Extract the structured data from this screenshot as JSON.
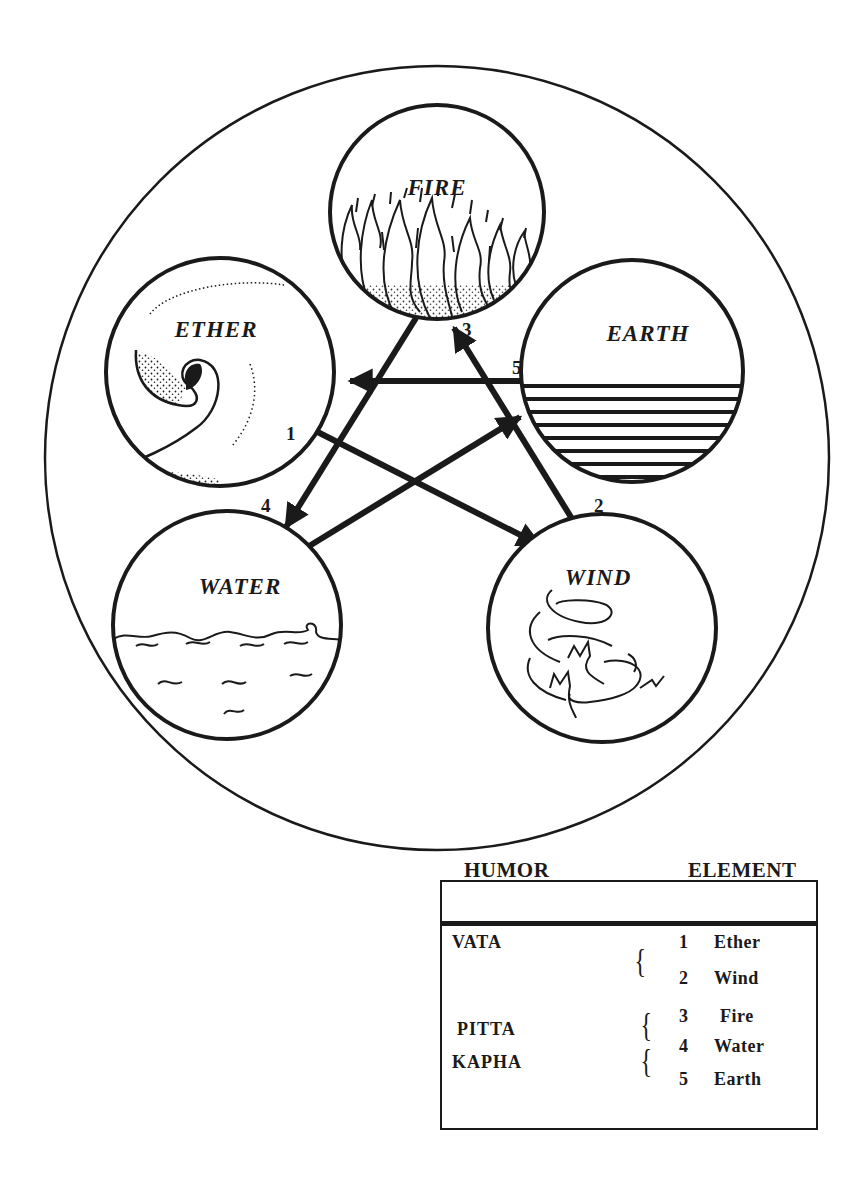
{
  "diagram": {
    "elements": [
      {
        "id": "fire",
        "label": "FIRE",
        "number": "3"
      },
      {
        "id": "ether",
        "label": "ETHER",
        "number": "1"
      },
      {
        "id": "earth",
        "label": "EARTH",
        "number": "5"
      },
      {
        "id": "water",
        "label": "WATER",
        "number": "4"
      },
      {
        "id": "wind",
        "label": "WIND",
        "number": "2"
      }
    ],
    "arrows": [
      {
        "from": "ether",
        "to": "wind"
      },
      {
        "from": "wind",
        "to": "fire"
      },
      {
        "from": "fire",
        "to": "water"
      },
      {
        "from": "water",
        "to": "earth"
      },
      {
        "from": "earth",
        "to": "ether"
      }
    ]
  },
  "table": {
    "headers": {
      "humor": "HUMOR",
      "element": "ELEMENT"
    },
    "rows": [
      {
        "humor": "VATA",
        "elements": [
          {
            "num": "1",
            "name": "Ether"
          },
          {
            "num": "2",
            "name": "Wind"
          }
        ]
      },
      {
        "humor": "PITTA",
        "elements": [
          {
            "num": "3",
            "name": "Fire"
          }
        ]
      },
      {
        "humor": "KAPHA",
        "elements": [
          {
            "num": "4",
            "name": "Water"
          },
          {
            "num": "5",
            "name": "Earth"
          }
        ]
      }
    ],
    "brace": "{"
  },
  "colors": {
    "ink": "#1a1a1a",
    "background": "#ffffff"
  }
}
